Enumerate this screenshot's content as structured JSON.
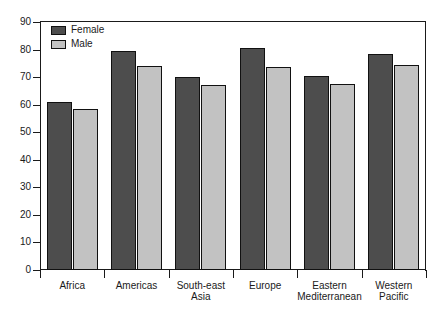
{
  "chart_data": {
    "type": "bar",
    "title": "",
    "subtitle": "",
    "xlabel": "",
    "ylabel": "",
    "ylim": [
      0,
      90
    ],
    "yticks": [
      0,
      10,
      20,
      30,
      40,
      50,
      60,
      70,
      80,
      90
    ],
    "grid": false,
    "legend_position": "top-left",
    "categories": [
      "Africa",
      "Americas",
      "South-east\nAsia",
      "Europe",
      "Eastern\nMediterranean",
      "Western\nPacific"
    ],
    "series": [
      {
        "name": "Female",
        "color": "#4d4d4d",
        "values": [
          61,
          79.5,
          70,
          80.5,
          70.5,
          78.5
        ]
      },
      {
        "name": "Male",
        "color": "#c2c2c2",
        "values": [
          58.5,
          74,
          67,
          73.5,
          67.5,
          74.5
        ]
      }
    ]
  },
  "legend": {
    "items": [
      {
        "label": "Female",
        "swatch": "female"
      },
      {
        "label": "Male",
        "swatch": "male"
      }
    ]
  },
  "axis": {
    "y_tick_labels": [
      "90",
      "80",
      "70",
      "60",
      "50",
      "40",
      "30",
      "20",
      "10",
      "0"
    ],
    "x_tick_labels": [
      "Africa",
      "Americas",
      "South-east Asia",
      "Europe",
      "Eastern Mediterranean",
      "Western Pacific"
    ]
  }
}
